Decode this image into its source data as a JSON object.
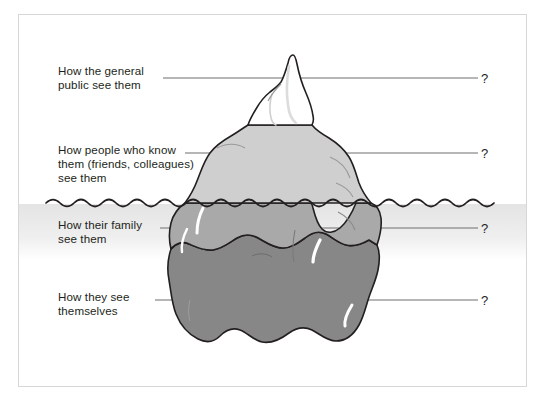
{
  "figure": {
    "type": "iceberg-diagram",
    "frame": {
      "border_color": "#d7d7d7",
      "background": "#ffffff"
    },
    "waterline": {
      "label": "waterline",
      "y": 203,
      "wave_color": "#231f20",
      "band_color": "#ececec"
    },
    "iceberg": {
      "tip_color": "#ffffff",
      "above_water_color": "#cfcfcf",
      "upper_submerged_color": "#a9a9a9",
      "lower_submerged_color": "#878787",
      "outline_color": "#231f20",
      "highlight_color": "#ffffff"
    },
    "labels": [
      {
        "id": "general-public",
        "text": "How the general\npublic see them",
        "answer": "?",
        "leader_y": 78,
        "zone": "tip (above water, visible to all)"
      },
      {
        "id": "people-who-know-them",
        "text": "How people who know\nthem (friends, colleagues)\nsee them",
        "answer": "?",
        "leader_y": 153,
        "zone": "above water body"
      },
      {
        "id": "family",
        "text": "How their family\nsee them",
        "answer": "?",
        "leader_y": 228,
        "zone": "upper submerged"
      },
      {
        "id": "themselves",
        "text": "How they see\nthemselves",
        "answer": "?",
        "leader_y": 300,
        "zone": "lower submerged"
      }
    ]
  }
}
